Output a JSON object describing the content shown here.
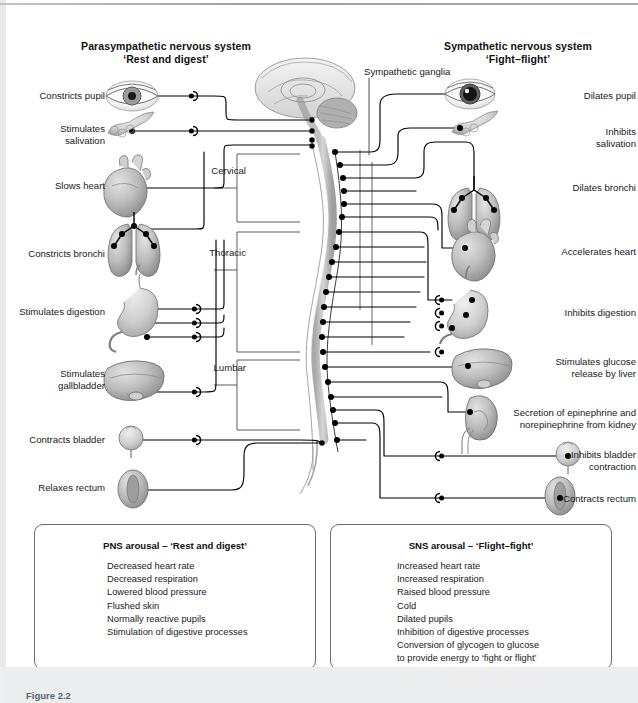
{
  "figure": {
    "caption": "Figure 2.2"
  },
  "headings": {
    "left_title_line1": "Parasympathetic nervous system",
    "left_title_line2": "‘Rest and digest’",
    "right_title_line1": "Sympathetic nervous system",
    "right_title_line2": "‘Fight–flight’",
    "ganglia_label": "Sympathetic ganglia"
  },
  "spinal_regions": [
    {
      "label": "Cervical"
    },
    {
      "label": "Thoracic"
    },
    {
      "label": "Lumbar"
    }
  ],
  "parasympathetic": {
    "title": "Parasympathetic nervous system",
    "subtitle": "‘Rest and digest’",
    "effects": [
      {
        "label": "Constricts pupil",
        "organ": "eye-icon",
        "y": 96
      },
      {
        "label": "Stimulates\nsalivation",
        "organ": "salivary-gland-icon",
        "y": 129
      },
      {
        "label": "Slows heart",
        "organ": "heart-icon",
        "y": 185
      },
      {
        "label": "Constricts bronchi",
        "organ": "lungs-icon",
        "y": 253
      },
      {
        "label": "Stimulates digestion",
        "organ": "stomach-icon",
        "y": 312
      },
      {
        "label": "Stimulates\ngallbladder",
        "organ": "liver-icon",
        "y": 374
      },
      {
        "label": "Contracts bladder",
        "organ": "bladder-icon",
        "y": 440
      },
      {
        "label": "Relaxes rectum",
        "organ": "rectum-icon",
        "y": 488
      }
    ]
  },
  "sympathetic": {
    "title": "Sympathetic nervous system",
    "subtitle": "‘Fight–flight’",
    "effects": [
      {
        "label": "Dilates pupil",
        "organ": "eye-icon",
        "y": 96
      },
      {
        "label": "Inhibits\nsalivation",
        "organ": "salivary-gland-icon",
        "y": 134
      },
      {
        "label": "Dilates bronchi",
        "organ": "lungs-icon",
        "y": 188
      },
      {
        "label": "Accelerates heart",
        "organ": "heart-icon",
        "y": 252
      },
      {
        "label": "Inhibits digestion",
        "organ": "stomach-icon",
        "y": 313
      },
      {
        "label": "Stimulates glucose\nrelease by liver",
        "organ": "liver-icon",
        "y": 362
      },
      {
        "label": "Secretion of epinephrine and\nnorepinephrine from kidney",
        "organ": "kidney-icon",
        "y": 413
      },
      {
        "label": "Inhibits bladder\ncontraction",
        "organ": "bladder-icon",
        "y": 455
      },
      {
        "label": "Contracts rectum",
        "organ": "rectum-icon",
        "y": 499
      }
    ]
  },
  "summary_left": {
    "title": "PNS arousal – ‘Rest and digest’",
    "items": [
      "Decreased heart rate",
      "Decreased respiration",
      "Lowered blood pressure",
      "Flushed skin",
      "Normally reactive pupils",
      "Stimulation of digestive processes"
    ]
  },
  "summary_right": {
    "title": "SNS arousal – ‘Flight–fight’",
    "items": [
      "Increased heart rate",
      "Increased respiration",
      "Raised blood pressure",
      "Cold",
      "Dilated pupils",
      "Inhibition of digestive processes",
      "Conversion of glycogen to glucose",
      "to provide energy to ‘fight or flight’"
    ]
  },
  "colors": {
    "line": "#000000",
    "organ_fill": "#b9b9b9",
    "organ_stroke": "#707070",
    "spinal_cord": "#c9c9c9",
    "box_border": "#6e6e6e",
    "page_background": "#ffffff",
    "bottom_band": "#ebedef",
    "caption_text": "#5a6570"
  }
}
